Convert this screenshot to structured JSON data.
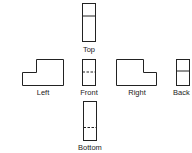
{
  "diagram": {
    "type": "orthographic-projection-views",
    "views": [
      {
        "id": "top",
        "label": "Top"
      },
      {
        "id": "left",
        "label": "Left"
      },
      {
        "id": "front",
        "label": "Front"
      },
      {
        "id": "right",
        "label": "Right"
      },
      {
        "id": "back",
        "label": "Back"
      },
      {
        "id": "bottom",
        "label": "Bottom"
      }
    ],
    "line_color": "#222222",
    "background": "#ffffff"
  }
}
